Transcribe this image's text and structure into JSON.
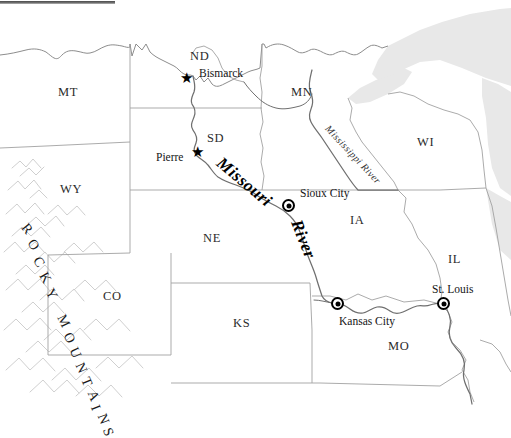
{
  "map": {
    "title_rule": "",
    "background_color": "#ffffff",
    "water_color": "#e8e8e8",
    "border_color": "#9a9a9a",
    "river_color": "#707070",
    "mountain_color": "#d0d0d0",
    "states": [
      {
        "abbr": "MT",
        "name": "Montana",
        "x": 68,
        "y": 92
      },
      {
        "abbr": "ND",
        "name": "North Dakota",
        "x": 196,
        "y": 57
      },
      {
        "abbr": "SD",
        "name": "South Dakota",
        "x": 213,
        "y": 139
      },
      {
        "abbr": "MN",
        "name": "Minnesota",
        "x": 298,
        "y": 93
      },
      {
        "abbr": "WI",
        "name": "Wisconsin",
        "x": 424,
        "y": 143
      },
      {
        "abbr": "WY",
        "name": "Wyoming",
        "x": 68,
        "y": 190
      },
      {
        "abbr": "NE",
        "name": "Nebraska",
        "x": 210,
        "y": 239
      },
      {
        "abbr": "IA",
        "name": "Iowa",
        "x": 355,
        "y": 221
      },
      {
        "abbr": "IL",
        "name": "Illinois",
        "x": 452,
        "y": 260
      },
      {
        "abbr": "CO",
        "name": "Colorado",
        "x": 110,
        "y": 297
      },
      {
        "abbr": "KS",
        "name": "Kansas",
        "x": 240,
        "y": 324
      },
      {
        "abbr": "MO",
        "name": "Missouri",
        "x": 396,
        "y": 347
      }
    ],
    "cities": [
      {
        "name": "Bismarck",
        "marker": "star",
        "label_x": 199,
        "label_y": 74,
        "dot_x": 186,
        "dot_y": 79,
        "align": "left"
      },
      {
        "name": "Pierre",
        "marker": "star",
        "label_x": 160,
        "label_y": 152,
        "dot_x": 197,
        "dot_y": 152,
        "align": "left"
      },
      {
        "name": "Sioux City",
        "marker": "dot",
        "label_x": 300,
        "label_y": 192,
        "dot_x": 288,
        "dot_y": 205,
        "align": "left"
      },
      {
        "name": "Kansas City",
        "marker": "dot",
        "label_x": 339,
        "label_y": 319,
        "dot_x": 337,
        "dot_y": 303,
        "align": "left"
      },
      {
        "name": "St. Louis",
        "marker": "dot",
        "label_x": 435,
        "label_y": 289,
        "dot_x": 443,
        "dot_y": 303,
        "align": "left"
      }
    ],
    "rivers": [
      {
        "name": "Missouri",
        "style": "bold-italic",
        "x": 219,
        "y": 152,
        "rotate": 40,
        "font_size": 17
      },
      {
        "name": "River",
        "style": "bold-italic",
        "x": 296,
        "y": 212,
        "rotate": 68,
        "font_size": 17
      },
      {
        "name": "Mississippi River",
        "style": "italic",
        "x": 327,
        "y": 122,
        "rotate": 47,
        "font_size": 10
      }
    ],
    "mountains": {
      "label": "ROCKY MOUNTAINS",
      "letters": [
        {
          "ch": "R",
          "x": 22,
          "y": 222,
          "rot": 52
        },
        {
          "ch": "O",
          "x": 28,
          "y": 238,
          "rot": 56
        },
        {
          "ch": "C",
          "x": 34,
          "y": 255,
          "rot": 58
        },
        {
          "ch": "K",
          "x": 40,
          "y": 271,
          "rot": 60
        },
        {
          "ch": "Y",
          "x": 46,
          "y": 287,
          "rot": 62
        },
        {
          "ch": " ",
          "x": 51,
          "y": 300,
          "rot": 63
        },
        {
          "ch": "M",
          "x": 57,
          "y": 314,
          "rot": 64
        },
        {
          "ch": "O",
          "x": 64,
          "y": 331,
          "rot": 64
        },
        {
          "ch": "U",
          "x": 70,
          "y": 346,
          "rot": 65
        },
        {
          "ch": "N",
          "x": 76,
          "y": 361,
          "rot": 66
        },
        {
          "ch": "T",
          "x": 82,
          "y": 375,
          "rot": 67
        },
        {
          "ch": "A",
          "x": 88,
          "y": 389,
          "rot": 68
        },
        {
          "ch": "I",
          "x": 93,
          "y": 401,
          "rot": 68
        },
        {
          "ch": "N",
          "x": 98,
          "y": 412,
          "rot": 69
        },
        {
          "ch": "S",
          "x": 104,
          "y": 425,
          "rot": 70
        }
      ]
    },
    "water_bodies": [
      {
        "name": "Lake Superior"
      },
      {
        "name": "Lake Michigan"
      }
    ]
  }
}
